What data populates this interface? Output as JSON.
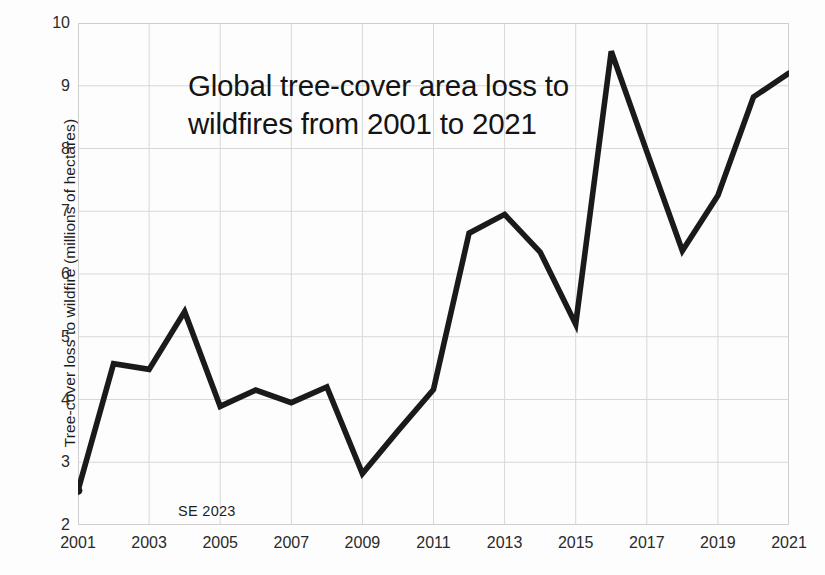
{
  "chart_data": {
    "type": "line",
    "title": "Global tree-cover area loss to wildfires from 2001 to 2021",
    "title_lines": [
      "Global tree-cover area loss to",
      "wildfires from 2001 to 2021"
    ],
    "xlabel": "",
    "ylabel": "Tree-cover loss to wildfire (millions of hectares)",
    "annotation": "SE 2023",
    "xlim": [
      2001,
      2021
    ],
    "ylim": [
      2,
      10
    ],
    "ytick_values": [
      2,
      3,
      4,
      5,
      6,
      7,
      8,
      9,
      10
    ],
    "ytick_labels": [
      "2",
      "3",
      "4",
      "5",
      "6",
      "7",
      "8",
      "9",
      "10"
    ],
    "xtick_values": [
      2001,
      2003,
      2005,
      2007,
      2009,
      2011,
      2013,
      2015,
      2017,
      2019,
      2021
    ],
    "xtick_labels": [
      "2001",
      "2003",
      "2005",
      "2007",
      "2009",
      "2011",
      "2013",
      "2015",
      "2017",
      "2019",
      "2021"
    ],
    "grid": true,
    "legend": "none",
    "line_color": "#1a1a1a",
    "grid_color": "#d8d8d8",
    "background_color": "#fdfdfd",
    "x": [
      2001,
      2002,
      2003,
      2004,
      2005,
      2006,
      2007,
      2008,
      2009,
      2010,
      2011,
      2012,
      2013,
      2014,
      2015,
      2016,
      2017,
      2018,
      2019,
      2020,
      2021
    ],
    "values": [
      2.55,
      4.57,
      4.48,
      5.4,
      3.89,
      4.15,
      3.95,
      4.2,
      2.82,
      3.5,
      4.16,
      6.65,
      6.95,
      6.35,
      5.2,
      9.55,
      7.95,
      6.37,
      7.25,
      8.82,
      9.2
    ],
    "series": [
      {
        "name": "Tree-cover loss to wildfire",
        "values": [
          2.55,
          4.57,
          4.48,
          5.4,
          3.89,
          4.15,
          3.95,
          4.2,
          2.82,
          3.5,
          4.16,
          6.65,
          6.95,
          6.35,
          5.2,
          9.55,
          7.95,
          6.37,
          7.25,
          8.82,
          9.2
        ]
      }
    ]
  }
}
